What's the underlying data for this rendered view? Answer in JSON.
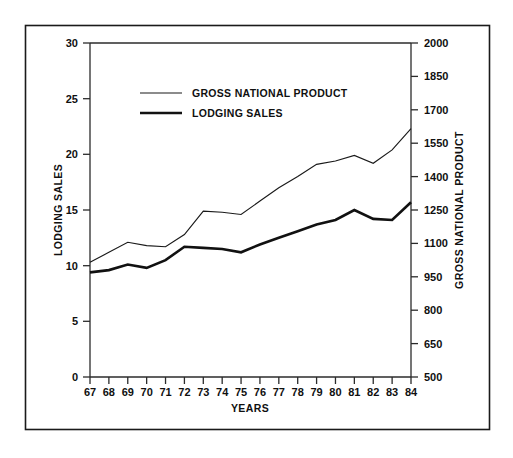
{
  "chart_data": {
    "type": "line",
    "title": "",
    "xlabel": "YEARS",
    "ylabel": "LODGING SALES",
    "y2label": "GROSS NATIONAL PRODUCT",
    "grid": false,
    "legend_position": "upper-left-inside",
    "categories": [
      "67",
      "68",
      "69",
      "70",
      "71",
      "72",
      "73",
      "74",
      "75",
      "76",
      "77",
      "78",
      "79",
      "80",
      "81",
      "82",
      "83",
      "84"
    ],
    "x": [
      1967,
      1968,
      1969,
      1970,
      1971,
      1972,
      1973,
      1974,
      1975,
      1976,
      1977,
      1978,
      1979,
      1980,
      1981,
      1982,
      1983,
      1984
    ],
    "ylim": [
      0,
      30
    ],
    "yticks": [
      0,
      5,
      10,
      15,
      20,
      25,
      30
    ],
    "ytick_labels": [
      "0",
      "5",
      "10",
      "15",
      "20",
      "25",
      "30"
    ],
    "y2lim": [
      500,
      2000
    ],
    "y2ticks": [
      500,
      650,
      800,
      950,
      1100,
      1250,
      1400,
      1550,
      1700,
      1850,
      2000
    ],
    "y2tick_labels": [
      "500",
      "650",
      "800",
      "950",
      "1100",
      "1250",
      "1400",
      "1550",
      "1700",
      "1850",
      "2000"
    ],
    "series": [
      {
        "name": "GROSS NATIONAL PRODUCT",
        "axis": "right",
        "units": "billions of dollars",
        "style": "thin",
        "values": [
          1015,
          1060,
          1105,
          1090,
          1085,
          1140,
          1245,
          1240,
          1230,
          1290,
          1350,
          1400,
          1455,
          1470,
          1495,
          1460,
          1520,
          1615
        ]
      },
      {
        "name": "LODGING SALES",
        "axis": "left",
        "units": "billions of dollars",
        "style": "thick",
        "values": [
          9.4,
          9.6,
          10.1,
          9.8,
          10.5,
          11.7,
          11.6,
          11.5,
          11.2,
          11.9,
          12.5,
          13.1,
          13.7,
          14.1,
          15.0,
          14.2,
          14.1,
          15.7
        ]
      }
    ]
  },
  "legend": {
    "entries": [
      {
        "label": "GROSS NATIONAL PRODUCT",
        "style": "thin"
      },
      {
        "label": "LODGING SALES",
        "style": "thick"
      }
    ]
  },
  "axes": {
    "left_title": "LODGING SALES",
    "right_title": "GROSS NATIONAL PRODUCT",
    "bottom_title": "YEARS"
  }
}
